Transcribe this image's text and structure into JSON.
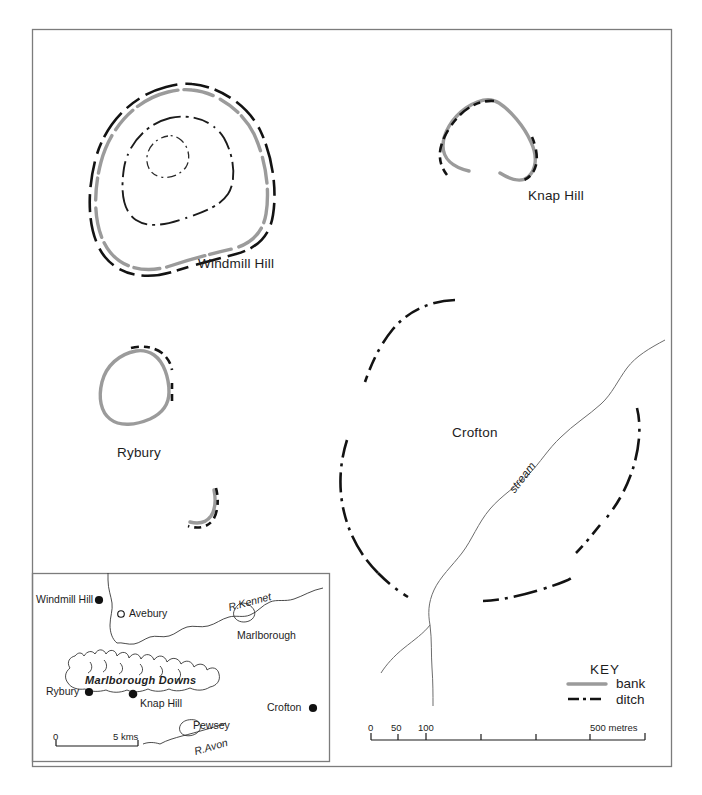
{
  "figure": {
    "type": "archaeological-site-plan-map",
    "frame": {
      "x": 32,
      "y": 29,
      "width": 640,
      "height": 738
    }
  },
  "main_map": {
    "site_labels": [
      {
        "name": "windmill-hill",
        "text": "Windmill Hill",
        "x": 198,
        "y": 256
      },
      {
        "name": "knap-hill",
        "text": "Knap Hill",
        "x": 528,
        "y": 188
      },
      {
        "name": "rybury",
        "text": "Rybury",
        "x": 117,
        "y": 445
      },
      {
        "name": "crofton",
        "text": "Crofton",
        "x": 452,
        "y": 425
      }
    ],
    "stream_label": "stream"
  },
  "key": {
    "title": "KEY",
    "items": [
      {
        "label": "bank",
        "style": "solid-grey-line",
        "color": "#9a9a9a"
      },
      {
        "label": "ditch",
        "style": "dash-dot-black-line",
        "color": "#111111"
      }
    ]
  },
  "main_scale": {
    "ticks": [
      {
        "value": "0",
        "labelled": true
      },
      {
        "value": "50",
        "labelled": true
      },
      {
        "value": "100",
        "labelled": true
      },
      {
        "value": "200",
        "labelled": false
      },
      {
        "value": "300",
        "labelled": false
      },
      {
        "value": "400",
        "labelled": false
      },
      {
        "value": "500",
        "labelled": false
      }
    ],
    "labels": {
      "zero": "0",
      "fifty": "50",
      "hundred": "100",
      "max": "500 metres"
    }
  },
  "inset_map": {
    "box": {
      "x": 32,
      "y": 573,
      "width": 298,
      "height": 189
    },
    "places": [
      {
        "name": "windmill-hill",
        "text": "Windmill Hill",
        "marker": "filled-dot"
      },
      {
        "name": "avebury",
        "text": "Avebury",
        "marker": "open-dot"
      },
      {
        "name": "marlborough",
        "text": "Marlborough",
        "marker": "none"
      },
      {
        "name": "rybury",
        "text": "Rybury",
        "marker": "filled-dot"
      },
      {
        "name": "knap-hill",
        "text": "Knap Hill",
        "marker": "filled-dot"
      },
      {
        "name": "crofton",
        "text": "Crofton",
        "marker": "filled-dot"
      },
      {
        "name": "pewsey",
        "text": "Pewsey",
        "marker": "none"
      }
    ],
    "rivers": [
      {
        "name": "river-kennet",
        "text": "R.Kennet"
      },
      {
        "name": "river-avon",
        "text": "R.Avon"
      }
    ],
    "region_label": "Marlborough Downs",
    "scale": {
      "zero": "0",
      "max": "5 kms"
    }
  }
}
